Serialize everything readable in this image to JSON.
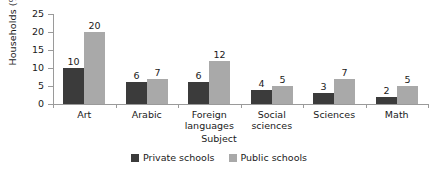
{
  "chart_data": {
    "type": "bar",
    "title": "",
    "xlabel": "Subject",
    "ylabel": "Households (%)",
    "categories": [
      "Art",
      "Arabic",
      "Foreign languages",
      "Social sciences",
      "Sciences",
      "Math"
    ],
    "category_lines": [
      [
        "Art"
      ],
      [
        "Arabic"
      ],
      [
        "Foreign",
        "languages"
      ],
      [
        "Social",
        "sciences"
      ],
      [
        "Sciences"
      ],
      [
        "Math"
      ]
    ],
    "series": [
      {
        "name": "Private schools",
        "color": "#3b3b3b",
        "values": [
          10,
          6,
          6,
          4,
          3,
          2
        ]
      },
      {
        "name": "Public schools",
        "color": "#a9a9a9",
        "values": [
          20,
          7,
          12,
          5,
          7,
          5
        ]
      }
    ],
    "ylim": [
      0,
      25
    ],
    "yticks": [
      0,
      5,
      10,
      15,
      20,
      25
    ],
    "ytick_labels": [
      "0",
      "5",
      "10",
      "15",
      "20",
      "25"
    ],
    "grid": false,
    "legend_position": "bottom",
    "data_labels": true
  },
  "legend": {
    "items": [
      {
        "label": "Private schools",
        "swatch": "private"
      },
      {
        "label": "Public schools",
        "swatch": "public"
      }
    ]
  }
}
